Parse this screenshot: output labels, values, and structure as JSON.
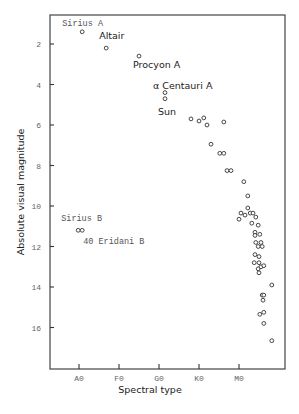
{
  "chart_data": {
    "type": "scatter",
    "title": "",
    "xlabel": "Spectral type",
    "ylabel": "Absolute visual magnitude",
    "x_ticks": [
      {
        "label": "A0",
        "value": 0
      },
      {
        "label": "F0",
        "value": 1
      },
      {
        "label": "G0",
        "value": 2
      },
      {
        "label": "K0",
        "value": 3
      },
      {
        "label": "M0",
        "value": 4
      }
    ],
    "y_ticks": [
      2,
      4,
      6,
      8,
      10,
      12,
      14,
      16
    ],
    "xlim": [
      -0.72,
      5.15
    ],
    "ylim": [
      17.55,
      0.55
    ],
    "y_inverted": true,
    "grid": false,
    "legend": null,
    "labeled_stars": [
      {
        "name": "Sirius A",
        "x": 0.08,
        "y": 1.4
      },
      {
        "name": "Altair",
        "x": 0.68,
        "y": 2.2
      },
      {
        "name": "Procyon A",
        "x": 1.5,
        "y": 2.6
      },
      {
        "name": "α Centauri A",
        "x": 2.15,
        "y": 4.4
      },
      {
        "name": "Sun",
        "x": 2.15,
        "y": 4.7
      },
      {
        "name": "Sirius B",
        "x": -0.02,
        "y": 11.2
      },
      {
        "name": "40 Eridani B",
        "x": 0.08,
        "y": 11.2
      }
    ],
    "series": [
      {
        "name": "Nearby stars",
        "points": [
          [
            2.8,
            5.7
          ],
          [
            3.0,
            5.8
          ],
          [
            3.12,
            5.65
          ],
          [
            3.2,
            6.0
          ],
          [
            3.62,
            5.85
          ],
          [
            3.3,
            6.95
          ],
          [
            3.52,
            7.4
          ],
          [
            3.62,
            7.4
          ],
          [
            3.7,
            8.25
          ],
          [
            3.8,
            8.25
          ],
          [
            4.12,
            8.8
          ],
          [
            4.22,
            9.5
          ],
          [
            4.22,
            10.1
          ],
          [
            4.05,
            10.35
          ],
          [
            4.15,
            10.45
          ],
          [
            4.28,
            10.35
          ],
          [
            4.35,
            10.35
          ],
          [
            4.0,
            10.65
          ],
          [
            4.42,
            10.55
          ],
          [
            4.32,
            10.85
          ],
          [
            4.48,
            10.95
          ],
          [
            4.4,
            11.3
          ],
          [
            4.4,
            11.45
          ],
          [
            4.52,
            11.4
          ],
          [
            4.42,
            11.8
          ],
          [
            4.48,
            12.0
          ],
          [
            4.55,
            11.8
          ],
          [
            4.58,
            12.0
          ],
          [
            4.4,
            12.4
          ],
          [
            4.5,
            12.5
          ],
          [
            4.38,
            12.8
          ],
          [
            4.5,
            12.8
          ],
          [
            4.48,
            13.1
          ],
          [
            4.55,
            13.0
          ],
          [
            4.62,
            12.95
          ],
          [
            4.5,
            13.3
          ],
          [
            4.82,
            13.9
          ],
          [
            4.58,
            14.4
          ],
          [
            4.62,
            14.4
          ],
          [
            4.6,
            14.65
          ],
          [
            4.52,
            15.35
          ],
          [
            4.62,
            15.25
          ],
          [
            4.62,
            15.8
          ],
          [
            4.82,
            16.65
          ]
        ]
      }
    ]
  },
  "colors": {
    "background": "#ffffff",
    "ink": "#333333",
    "tick_label": "#666666"
  }
}
